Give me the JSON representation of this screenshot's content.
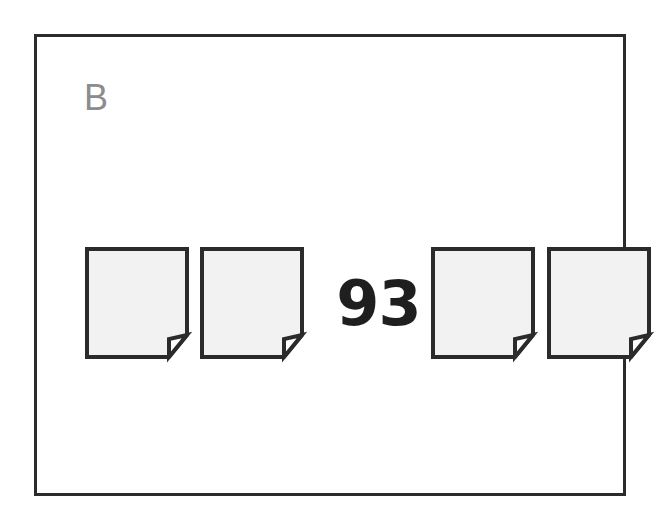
{
  "panel": {
    "label": "B",
    "label_color": "#8c8c8c",
    "border_color": "#2b2b2b",
    "background_color": "#ffffff"
  },
  "stimulus": {
    "center_value": "93",
    "center_value_color": "#1f1f1f",
    "icon_name": "document-page-icon",
    "icon_fill_color": "#f2f2f2",
    "icon_outline_color": "#2b2b2b",
    "left_group_count": "2",
    "right_group_count": "2",
    "total_icon_count": "4",
    "items": [
      {
        "id": "doc-1",
        "group": "left",
        "label": "document-icon-1"
      },
      {
        "id": "doc-2",
        "group": "left",
        "label": "document-icon-2"
      },
      {
        "id": "doc-3",
        "group": "right",
        "label": "document-icon-3"
      },
      {
        "id": "doc-4",
        "group": "right",
        "label": "document-icon-4"
      }
    ]
  }
}
